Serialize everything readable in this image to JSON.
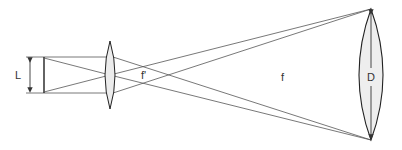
{
  "diagram": {
    "type": "optical-ray-diagram",
    "labels": {
      "object_size": "L",
      "eyepiece_focal": "f'",
      "objective_focal": "f",
      "aperture": "D"
    },
    "colors": {
      "line": "#444444",
      "lens_fill": "#e8e8e8",
      "background": "#ffffff"
    }
  }
}
